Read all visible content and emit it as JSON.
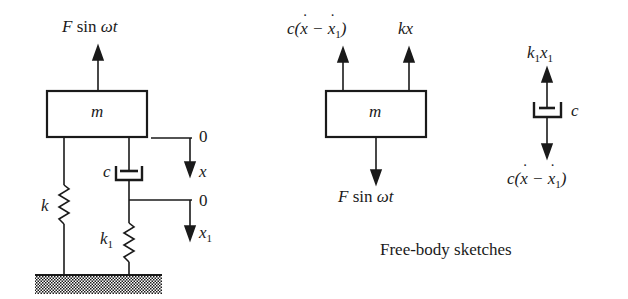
{
  "system": {
    "mass_label": "m",
    "force_label": "F sin ωt",
    "spring_k_label": "k",
    "spring_k1_label": "k",
    "spring_k1_sub": "1",
    "damper_label": "c",
    "coord_x_zero": "0",
    "coord_x_label": "x",
    "coord_x1_zero": "0",
    "coord_x1_label": "x",
    "coord_x1_sub": "1"
  },
  "fbd_mass": {
    "mass_label": "m",
    "damper_force_label": "c(ẋ − ẋ₁)",
    "spring_force_label": "kx",
    "applied_force_label": "F sin ωt"
  },
  "fbd_damper": {
    "top_force_label": "k₁x₁",
    "damper_label": "c",
    "bottom_force_label": "c(ẋ − ẋ₁)"
  },
  "caption": "Free-body sketches",
  "colors": {
    "ink": "#1a1a1a",
    "background": "#ffffff"
  }
}
